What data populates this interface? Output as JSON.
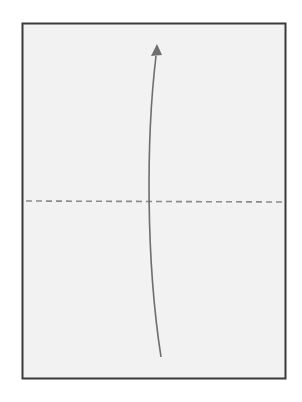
{
  "diagram": {
    "type": "fold-instruction",
    "paper": {
      "x": 22,
      "y": 23,
      "width": 264,
      "height": 356,
      "fill": "#f2f2f2",
      "stroke": "#3a3a3a"
    },
    "fold_line": {
      "style": "dashed",
      "y": 201,
      "color": "#8a8a8a",
      "label": "valley fold"
    },
    "arrow": {
      "direction": "up",
      "color": "#6e6e6e",
      "from": [
        161,
        357
      ],
      "to": [
        155,
        46
      ]
    }
  }
}
